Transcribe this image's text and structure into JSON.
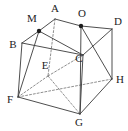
{
  "figure": {
    "background_color": "#ffffff",
    "stroke_color": "#3a3a3a",
    "hidden_stroke_color": "#6a6a6a",
    "dot_color": "#1c1c1c",
    "label_color": "#1c1c1c",
    "labels": {
      "A": "A",
      "B": "B",
      "C": "C",
      "D": "D",
      "E": "E",
      "F": "F",
      "G": "G",
      "H": "H",
      "M": "M",
      "O": "O"
    },
    "label_positions": {
      "A": {
        "x": 55,
        "y": 12
      },
      "B": {
        "x": 13,
        "y": 48
      },
      "C": {
        "x": 79,
        "y": 62
      },
      "D": {
        "x": 118,
        "y": 25
      },
      "E": {
        "x": 45,
        "y": 69
      },
      "F": {
        "x": 10,
        "y": 103
      },
      "G": {
        "x": 79,
        "y": 126
      },
      "H": {
        "x": 120,
        "y": 83
      },
      "M": {
        "x": 32,
        "y": 22
      },
      "O": {
        "x": 82,
        "y": 17
      }
    },
    "vertices": {
      "A": {
        "x": 55,
        "y": 19
      },
      "B": {
        "x": 22,
        "y": 43
      },
      "C": {
        "x": 83,
        "y": 55
      },
      "D": {
        "x": 112,
        "y": 29
      },
      "E": {
        "x": 48,
        "y": 76
      },
      "F": {
        "x": 18,
        "y": 97
      },
      "G": {
        "x": 80,
        "y": 114
      },
      "H": {
        "x": 112,
        "y": 79
      },
      "M": {
        "x": 39,
        "y": 31
      },
      "O": {
        "x": 81,
        "y": 26
      }
    },
    "marked_points": [
      "M",
      "O"
    ],
    "solid_edges": [
      [
        "M",
        "A"
      ],
      [
        "A",
        "O"
      ],
      [
        "O",
        "D"
      ],
      [
        "B",
        "M"
      ],
      [
        "B",
        "C"
      ],
      [
        "C",
        "D"
      ],
      [
        "D",
        "H"
      ],
      [
        "B",
        "F"
      ],
      [
        "F",
        "G"
      ],
      [
        "G",
        "H"
      ],
      [
        "C",
        "G"
      ]
    ],
    "hidden_edges": [
      [
        "A",
        "E"
      ],
      [
        "E",
        "F"
      ],
      [
        "E",
        "C"
      ],
      [
        "E",
        "G"
      ],
      [
        "F",
        "H"
      ]
    ],
    "cut_edges": [
      [
        "M",
        "F"
      ],
      [
        "O",
        "H"
      ],
      [
        "M",
        "C"
      ],
      [
        "O",
        "G"
      ],
      [
        "F",
        "H"
      ]
    ]
  }
}
